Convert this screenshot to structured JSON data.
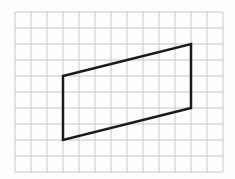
{
  "diagram": {
    "type": "parallelogram-on-grid",
    "grid": {
      "columns": 13,
      "rows": 10,
      "cell_size": 16,
      "origin_x": 15,
      "origin_y": 12,
      "line_color": "#c8c8c8"
    },
    "shape": {
      "name": "parallelogram",
      "stroke_color": "#1a1a1a",
      "vertices_grid": [
        [
          3,
          4
        ],
        [
          11,
          2
        ],
        [
          11,
          6
        ],
        [
          3,
          8
        ]
      ]
    }
  }
}
